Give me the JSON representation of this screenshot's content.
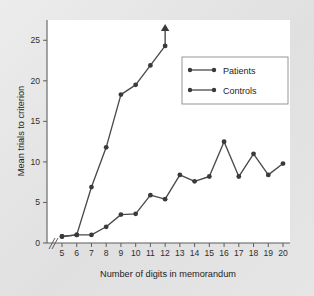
{
  "chart_data": {
    "type": "line",
    "title": "",
    "xlabel": "Number of digits in memorandum",
    "ylabel": "Mean trials to criterion",
    "xlim": [
      5,
      20
    ],
    "ylim": [
      0,
      27.5
    ],
    "xticks": [
      5,
      6,
      7,
      8,
      9,
      10,
      11,
      12,
      13,
      14,
      15,
      16,
      17,
      18,
      19,
      20
    ],
    "yticks": [
      0,
      5,
      10,
      15,
      20,
      25
    ],
    "xtick_labels": [
      "5",
      "6",
      "7",
      "8",
      "9",
      "10",
      "11",
      "12",
      "13",
      "14",
      "15",
      "16",
      "17",
      "18",
      "19",
      "20"
    ],
    "ytick_labels": [
      "0",
      "5",
      "10",
      "15",
      "20",
      "25"
    ],
    "grid": false,
    "axis_break_x": true,
    "legend_position": "upper right",
    "series": [
      {
        "name": "Patients",
        "x": [
          5,
          6,
          7,
          8,
          9,
          10,
          11,
          12
        ],
        "values": [
          0.8,
          1.0,
          6.9,
          11.8,
          18.3,
          19.5,
          21.9,
          24.3
        ],
        "arrow_at_end": true,
        "arrow_note": "continues upward beyond axis"
      },
      {
        "name": "Controls",
        "x": [
          5,
          6,
          7,
          8,
          9,
          10,
          11,
          12,
          13,
          14,
          15,
          16,
          17,
          18,
          19,
          20
        ],
        "values": [
          0.8,
          1.0,
          1.0,
          2.0,
          3.5,
          3.6,
          5.9,
          5.4,
          8.4,
          7.6,
          8.2,
          12.5,
          8.2,
          11.0,
          8.4,
          9.8
        ]
      }
    ],
    "colors": {
      "line": "#4a4a4a",
      "marker": "#3a3a3a",
      "axis": "#5d5d5d",
      "plot_background": "#ffffff",
      "figure_background": "#e3e3e3"
    }
  },
  "legend": {
    "entries": [
      {
        "label": "Patients"
      },
      {
        "label": "Controls"
      }
    ]
  },
  "axes": {
    "x_title": "Number of digits in memorandum",
    "y_title": "Mean trials to criterion"
  }
}
